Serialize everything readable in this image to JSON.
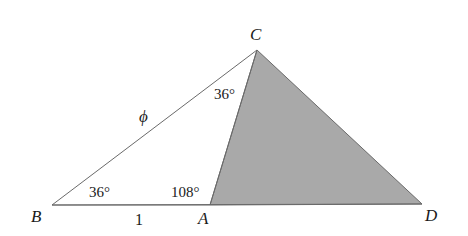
{
  "diagram": {
    "vertices": {
      "B": {
        "label": "B",
        "x": 52,
        "y": 205
      },
      "A": {
        "label": "A",
        "x": 210,
        "y": 205
      },
      "D": {
        "label": "D",
        "x": 422,
        "y": 204
      },
      "C": {
        "label": "C",
        "x": 257,
        "y": 50
      }
    },
    "angles": {
      "B": "36°",
      "A": "108°",
      "C": "36°"
    },
    "sides": {
      "BC": "ϕ",
      "BA": "1"
    },
    "colors": {
      "shaded_fill": "#a9a9a9",
      "stroke": "#6a6a6a",
      "text": "#1a1a1a"
    }
  }
}
